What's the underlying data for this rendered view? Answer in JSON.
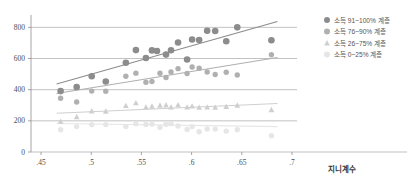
{
  "chart_data": {
    "type": "scatter",
    "title": "",
    "subtitle": "",
    "xlabel": "지니계수",
    "ylabel": "",
    "xlim": [
      0.44,
      0.705
    ],
    "ylim": [
      0,
      860
    ],
    "grid": true,
    "legend_position": "right",
    "xticks": [
      ".45",
      ".5",
      ".55",
      ".6",
      ".65",
      ".7"
    ],
    "xtick_values": [
      0.45,
      0.5,
      0.55,
      0.6,
      0.65,
      0.7
    ],
    "yticks": [
      "0",
      "200",
      "400",
      "600",
      "800"
    ],
    "ytick_values": [
      0,
      200,
      400,
      600,
      800
    ],
    "series": [
      {
        "name": "소득 91~100% 계층",
        "color": "#8c8c8c",
        "marker": "circle",
        "marker_size": 3.3,
        "trend": {
          "x0": 0.4655,
          "y0": 437,
          "x1": 0.6855,
          "y1": 838
        },
        "points": [
          {
            "x": 0.4695,
            "y": 391
          },
          {
            "x": 0.4855,
            "y": 417
          },
          {
            "x": 0.5005,
            "y": 486
          },
          {
            "x": 0.5145,
            "y": 452
          },
          {
            "x": 0.5345,
            "y": 573
          },
          {
            "x": 0.5445,
            "y": 654
          },
          {
            "x": 0.5545,
            "y": 603
          },
          {
            "x": 0.5605,
            "y": 652
          },
          {
            "x": 0.5655,
            "y": 648
          },
          {
            "x": 0.5745,
            "y": 625
          },
          {
            "x": 0.5795,
            "y": 653
          },
          {
            "x": 0.5865,
            "y": 703
          },
          {
            "x": 0.5955,
            "y": 594
          },
          {
            "x": 0.6005,
            "y": 722
          },
          {
            "x": 0.6075,
            "y": 719
          },
          {
            "x": 0.6155,
            "y": 778
          },
          {
            "x": 0.6235,
            "y": 777
          },
          {
            "x": 0.6345,
            "y": 711
          },
          {
            "x": 0.6455,
            "y": 800
          },
          {
            "x": 0.6795,
            "y": 717
          }
        ]
      },
      {
        "name": "소득 76~90% 계층",
        "color": "#b0b0b0",
        "marker": "circle",
        "marker_size": 2.7,
        "trend": {
          "x0": 0.4655,
          "y0": 375,
          "x1": 0.6855,
          "y1": 606
        },
        "points": [
          {
            "x": 0.4695,
            "y": 345
          },
          {
            "x": 0.4855,
            "y": 321
          },
          {
            "x": 0.5005,
            "y": 391
          },
          {
            "x": 0.5145,
            "y": 390
          },
          {
            "x": 0.5345,
            "y": 486
          },
          {
            "x": 0.5445,
            "y": 506
          },
          {
            "x": 0.5545,
            "y": 448
          },
          {
            "x": 0.5605,
            "y": 452
          },
          {
            "x": 0.5685,
            "y": 505
          },
          {
            "x": 0.5745,
            "y": 478
          },
          {
            "x": 0.5795,
            "y": 513
          },
          {
            "x": 0.5865,
            "y": 535
          },
          {
            "x": 0.5955,
            "y": 504
          },
          {
            "x": 0.6005,
            "y": 546
          },
          {
            "x": 0.6075,
            "y": 538
          },
          {
            "x": 0.6155,
            "y": 513
          },
          {
            "x": 0.6235,
            "y": 497
          },
          {
            "x": 0.6345,
            "y": 512
          },
          {
            "x": 0.6455,
            "y": 494
          },
          {
            "x": 0.6795,
            "y": 624
          }
        ]
      },
      {
        "name": "소득 26~75% 계층",
        "color": "#cfcfcf",
        "marker": "triangle",
        "marker_size": 3.0,
        "trend": {
          "x0": 0.4655,
          "y0": 249,
          "x1": 0.6855,
          "y1": 311
        },
        "points": [
          {
            "x": 0.4695,
            "y": 196
          },
          {
            "x": 0.4855,
            "y": 226
          },
          {
            "x": 0.5005,
            "y": 263
          },
          {
            "x": 0.5145,
            "y": 261
          },
          {
            "x": 0.5345,
            "y": 297
          },
          {
            "x": 0.5445,
            "y": 315
          },
          {
            "x": 0.5545,
            "y": 288
          },
          {
            "x": 0.5605,
            "y": 293
          },
          {
            "x": 0.5685,
            "y": 300
          },
          {
            "x": 0.5745,
            "y": 301
          },
          {
            "x": 0.5795,
            "y": 288
          },
          {
            "x": 0.5865,
            "y": 302
          },
          {
            "x": 0.5955,
            "y": 288
          },
          {
            "x": 0.6005,
            "y": 294
          },
          {
            "x": 0.6075,
            "y": 286
          },
          {
            "x": 0.6155,
            "y": 288
          },
          {
            "x": 0.6235,
            "y": 286
          },
          {
            "x": 0.6345,
            "y": 292
          },
          {
            "x": 0.6455,
            "y": 300
          },
          {
            "x": 0.6795,
            "y": 271
          }
        ]
      },
      {
        "name": "소득 0~25% 계층",
        "color": "#e6e6e6",
        "marker": "circle",
        "marker_size": 2.7,
        "trend": {
          "x0": 0.4655,
          "y0": 183,
          "x1": 0.6855,
          "y1": 163
        },
        "points": [
          {
            "x": 0.4695,
            "y": 143
          },
          {
            "x": 0.4855,
            "y": 163
          },
          {
            "x": 0.5005,
            "y": 176
          },
          {
            "x": 0.5145,
            "y": 176
          },
          {
            "x": 0.5345,
            "y": 163
          },
          {
            "x": 0.5445,
            "y": 182
          },
          {
            "x": 0.5545,
            "y": 177
          },
          {
            "x": 0.5605,
            "y": 180
          },
          {
            "x": 0.5685,
            "y": 158
          },
          {
            "x": 0.5745,
            "y": 178
          },
          {
            "x": 0.5795,
            "y": 182
          },
          {
            "x": 0.5865,
            "y": 167
          },
          {
            "x": 0.5955,
            "y": 145
          },
          {
            "x": 0.6005,
            "y": 163
          },
          {
            "x": 0.6075,
            "y": 130
          },
          {
            "x": 0.6155,
            "y": 148
          },
          {
            "x": 0.6235,
            "y": 147
          },
          {
            "x": 0.6345,
            "y": 134
          },
          {
            "x": 0.6455,
            "y": 143
          },
          {
            "x": 0.6795,
            "y": 104
          }
        ]
      }
    ]
  },
  "legend": {
    "items": [
      {
        "label": "소득 91~100% 계층"
      },
      {
        "label": "소득 76~90% 계층"
      },
      {
        "label": "소득 26~75% 계층"
      },
      {
        "label": "소득 0~25% 계층"
      }
    ]
  },
  "axis": {
    "x_title": "지니계수"
  }
}
